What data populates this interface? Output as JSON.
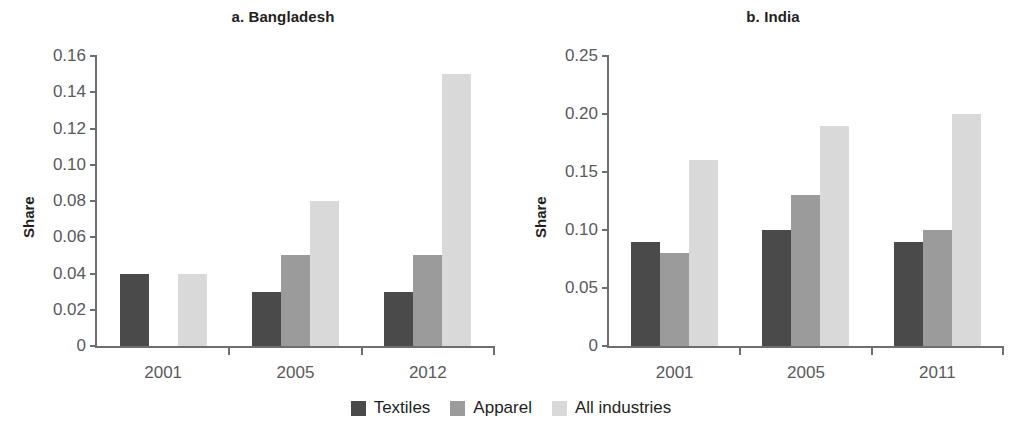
{
  "legend": {
    "items": [
      {
        "label": "Textiles",
        "color": "#4a4a4a"
      },
      {
        "label": "Apparel",
        "color": "#9b9b9b"
      },
      {
        "label": "All industries",
        "color": "#d9d9d9"
      }
    ]
  },
  "chart_data": [
    {
      "type": "bar",
      "title": "a. Bangladesh",
      "xlabel": "",
      "ylabel": "Share",
      "categories": [
        "2001",
        "2005",
        "2012"
      ],
      "series": [
        {
          "name": "Textiles",
          "color": "#4a4a4a",
          "values": [
            0.04,
            0.03,
            0.03
          ]
        },
        {
          "name": "Apparel",
          "color": "#9b9b9b",
          "values": [
            0,
            0.05,
            0.05
          ]
        },
        {
          "name": "All industries",
          "color": "#d9d9d9",
          "values": [
            0.04,
            0.08,
            0.15
          ]
        }
      ],
      "ylim": [
        0,
        0.16
      ],
      "yticks": [
        0,
        0.02,
        0.04,
        0.06,
        0.08,
        0.1,
        0.12,
        0.14,
        0.16
      ],
      "yticklabels": [
        "0",
        "0.02",
        "0.04",
        "0.06",
        "0.08",
        "0.10",
        "0.12",
        "0.14",
        "0.16"
      ],
      "grid": false,
      "legend_position": "bottom-center"
    },
    {
      "type": "bar",
      "title": "b. India",
      "xlabel": "",
      "ylabel": "Share",
      "categories": [
        "2001",
        "2005",
        "2011"
      ],
      "series": [
        {
          "name": "Textiles",
          "color": "#4a4a4a",
          "values": [
            0.09,
            0.1,
            0.09
          ]
        },
        {
          "name": "Apparel",
          "color": "#9b9b9b",
          "values": [
            0.08,
            0.13,
            0.1
          ]
        },
        {
          "name": "All industries",
          "color": "#d9d9d9",
          "values": [
            0.16,
            0.19,
            0.2
          ]
        }
      ],
      "ylim": [
        0,
        0.25
      ],
      "yticks": [
        0,
        0.05,
        0.1,
        0.15,
        0.2,
        0.25
      ],
      "yticklabels": [
        "0",
        "0.05",
        "0.10",
        "0.15",
        "0.20",
        "0.25"
      ],
      "grid": false,
      "legend_position": "bottom-center"
    }
  ]
}
